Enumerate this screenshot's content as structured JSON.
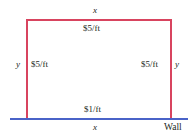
{
  "figure": {
    "colors": {
      "fence": "#d8445f",
      "wall": "#4a63c8",
      "text": "#231f20",
      "background": "#ffffff"
    }
  },
  "labels": {
    "top_dimension": "x",
    "top_cost": "$5/ft",
    "left_dimension": "y",
    "left_cost": "$5/ft",
    "right_cost": "$5/ft",
    "right_dimension": "y",
    "bottom_cost": "$1/ft",
    "bottom_dimension": "x",
    "wall": "Wall"
  },
  "chart_data": {
    "type": "diagram",
    "shape": "rectangle",
    "sides": [
      {
        "position": "top",
        "dimension": "x",
        "cost": "$5/ft",
        "color": "#d8445f",
        "kind": "fence"
      },
      {
        "position": "left",
        "dimension": "y",
        "cost": "$5/ft",
        "color": "#d8445f",
        "kind": "fence"
      },
      {
        "position": "right",
        "dimension": "y",
        "cost": "$5/ft",
        "color": "#d8445f",
        "kind": "fence"
      },
      {
        "position": "bottom",
        "dimension": "x",
        "cost": "$1/ft",
        "color": "#4a63c8",
        "kind": "wall"
      }
    ],
    "annotations": [
      "Wall"
    ]
  }
}
